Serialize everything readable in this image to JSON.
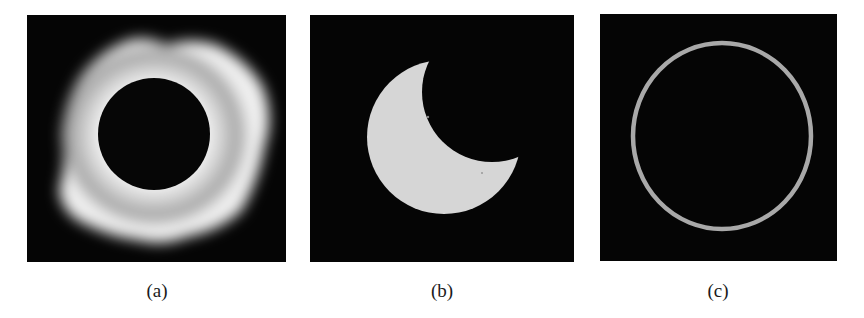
{
  "figure": {
    "panels": [
      {
        "id": "a",
        "label": "(a)",
        "subject": "total solar eclipse with corona",
        "description": "dark lunar disk surrounded by bright irregular corona"
      },
      {
        "id": "b",
        "label": "(b)",
        "subject": "partial solar eclipse",
        "description": "bright solar disk partially covered by moon from upper right, forming crescent"
      },
      {
        "id": "c",
        "label": "(c)",
        "subject": "annular solar eclipse",
        "description": "thin bright ring around dark lunar disk"
      }
    ],
    "colors": {
      "background": "#ffffff",
      "panel_bg": "#050505",
      "sun": "#d9d9d9",
      "corona": "#f2f2f2",
      "ring": "#a8a8a8",
      "caption": "#1a1a1a"
    }
  }
}
